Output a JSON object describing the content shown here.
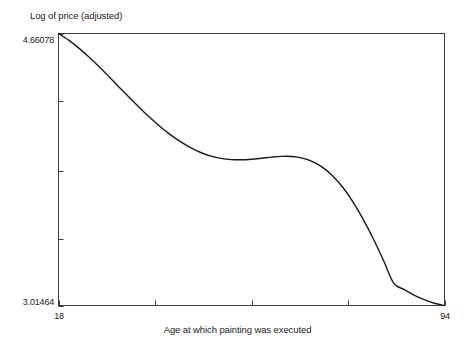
{
  "chart_data": {
    "type": "line",
    "title": "",
    "xlabel": "Age at which painting was executed",
    "ylabel": "Log of price (adjusted)",
    "xlim": [
      18,
      94
    ],
    "ylim": [
      3.01464,
      4.66078
    ],
    "xticks": [
      18,
      37,
      56,
      75,
      94
    ],
    "xtick_labels_shown": [
      "18",
      "94"
    ],
    "yticks": [
      3.01464,
      3.42,
      3.83,
      4.25,
      4.66078
    ],
    "ytick_labels_shown": [
      "3.01464",
      "4.66078"
    ],
    "grid": false,
    "legend": null,
    "series": [
      {
        "name": "fitted price curve",
        "color": "#1a1a1a",
        "x": [
          18,
          20,
          22,
          24,
          26,
          28,
          30,
          32,
          34,
          36,
          38,
          40,
          42,
          44,
          46,
          48,
          50,
          52,
          54,
          56,
          58,
          60,
          62,
          64,
          66,
          68,
          70,
          72,
          74,
          76,
          78,
          80,
          82,
          84,
          86,
          88,
          90,
          92,
          94
        ],
        "y": [
          4.6608,
          4.6205,
          4.5723,
          4.518,
          4.4592,
          4.3975,
          4.3345,
          4.2717,
          4.2105,
          4.1522,
          4.098,
          4.049,
          4.006,
          3.9697,
          3.9406,
          3.919,
          3.9048,
          3.8976,
          3.8965,
          3.9,
          3.9062,
          3.9128,
          3.9171,
          3.9162,
          3.9068,
          3.8859,
          3.8506,
          3.7986,
          3.7287,
          3.6408,
          3.536,
          3.4168,
          3.2866,
          3.15,
          3.112,
          3.078,
          3.05,
          3.028,
          3.0146
        ]
      }
    ],
    "annotations": []
  },
  "axes": {
    "ylabel_text": "Log of price (adjusted)",
    "xlabel_text": "Age at which painting was executed",
    "ytick_top_text": "4.66078",
    "ytick_bottom_text": "3.01464",
    "xtick_left_text": "18",
    "xtick_right_text": "94",
    "frame_color": "#3c3c3c",
    "curve_color": "#1a1a1a",
    "background_color": "#ffffff"
  }
}
